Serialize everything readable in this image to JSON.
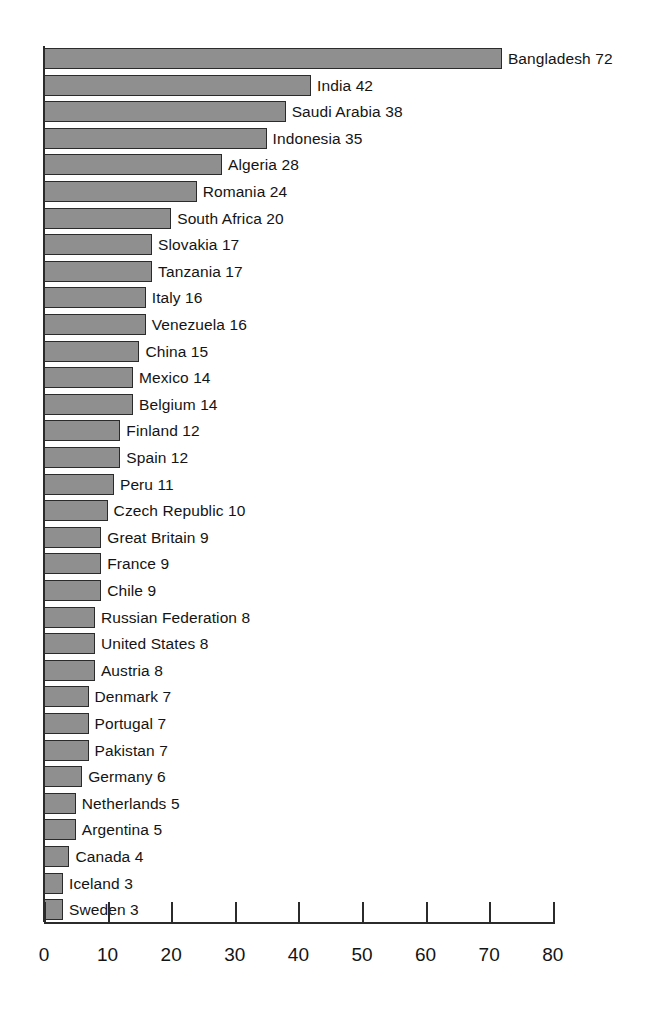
{
  "chart_data": {
    "type": "bar",
    "orientation": "horizontal",
    "title": "",
    "subtitle": "",
    "xlabel": "",
    "ylabel": "",
    "xlim": [
      0,
      80
    ],
    "xticks": [
      0,
      10,
      20,
      30,
      40,
      50,
      60,
      70,
      80
    ],
    "xtick_labels": [
      "0",
      "10",
      "20",
      "30",
      "40",
      "50",
      "60",
      "70",
      "80"
    ],
    "grid": false,
    "legend": false,
    "bar_color": "#8f8f8f",
    "bar_edge_color": "#2b2b2b",
    "axis_color": "#2b2b2b",
    "label_format": "name value",
    "categories": [
      "Bangladesh",
      "India",
      "Saudi Arabia",
      "Indonesia",
      "Algeria",
      "Romania",
      "South Africa",
      "Slovakia",
      "Tanzania",
      "Italy",
      "Venezuela",
      "China",
      "Mexico",
      "Belgium",
      "Finland",
      "Spain",
      "Peru",
      "Czech Republic",
      "Great Britain",
      "France",
      "Chile",
      "Russian Federation",
      "United States",
      "Austria",
      "Denmark",
      "Portugal",
      "Pakistan",
      "Germany",
      "Netherlands",
      "Argentina",
      "Canada",
      "Iceland",
      "Sweden"
    ],
    "values": [
      72,
      42,
      38,
      35,
      28,
      24,
      20,
      17,
      17,
      16,
      16,
      15,
      14,
      14,
      12,
      12,
      11,
      10,
      9,
      9,
      9,
      8,
      8,
      8,
      7,
      7,
      7,
      6,
      5,
      5,
      4,
      3,
      3
    ],
    "bars": [
      {
        "label": "Bangladesh 72",
        "name": "Bangladesh",
        "value": 72
      },
      {
        "label": "India 42",
        "name": "India",
        "value": 42
      },
      {
        "label": "Saudi Arabia 38",
        "name": "Saudi Arabia",
        "value": 38
      },
      {
        "label": "Indonesia 35",
        "name": "Indonesia",
        "value": 35
      },
      {
        "label": "Algeria 28",
        "name": "Algeria",
        "value": 28
      },
      {
        "label": "Romania 24",
        "name": "Romania",
        "value": 24
      },
      {
        "label": "South Africa 20",
        "name": "South Africa",
        "value": 20
      },
      {
        "label": "Slovakia 17",
        "name": "Slovakia",
        "value": 17
      },
      {
        "label": "Tanzania 17",
        "name": "Tanzania",
        "value": 17
      },
      {
        "label": "Italy 16",
        "name": "Italy",
        "value": 16
      },
      {
        "label": "Venezuela 16",
        "name": "Venezuela",
        "value": 16
      },
      {
        "label": "China 15",
        "name": "China",
        "value": 15
      },
      {
        "label": "Mexico 14",
        "name": "Mexico",
        "value": 14
      },
      {
        "label": "Belgium 14",
        "name": "Belgium",
        "value": 14
      },
      {
        "label": "Finland 12",
        "name": "Finland",
        "value": 12
      },
      {
        "label": "Spain 12",
        "name": "Spain",
        "value": 12
      },
      {
        "label": "Peru 11",
        "name": "Peru",
        "value": 11
      },
      {
        "label": "Czech Republic 10",
        "name": "Czech Republic",
        "value": 10
      },
      {
        "label": "Great Britain 9",
        "name": "Great Britain",
        "value": 9
      },
      {
        "label": "France 9",
        "name": "France",
        "value": 9
      },
      {
        "label": "Chile 9",
        "name": "Chile",
        "value": 9
      },
      {
        "label": "Russian Federation 8",
        "name": "Russian Federation",
        "value": 8
      },
      {
        "label": "United States 8",
        "name": "United States",
        "value": 8
      },
      {
        "label": "Austria 8",
        "name": "Austria",
        "value": 8
      },
      {
        "label": "Denmark 7",
        "name": "Denmark",
        "value": 7
      },
      {
        "label": "Portugal 7",
        "name": "Portugal",
        "value": 7
      },
      {
        "label": "Pakistan 7",
        "name": "Pakistan",
        "value": 7
      },
      {
        "label": "Germany 6",
        "name": "Germany",
        "value": 6
      },
      {
        "label": "Netherlands 5",
        "name": "Netherlands",
        "value": 5
      },
      {
        "label": "Argentina 5",
        "name": "Argentina",
        "value": 5
      },
      {
        "label": "Canada 4",
        "name": "Canada",
        "value": 4
      },
      {
        "label": "Iceland 3",
        "name": "Iceland",
        "value": 3
      },
      {
        "label": "Sweden 3",
        "name": "Sweden",
        "value": 3
      }
    ]
  },
  "layout": {
    "origin_x": 44,
    "first_row_top": 48,
    "row_pitch": 26.6,
    "bar_height": 21,
    "px_per_unit": 6.36
  }
}
